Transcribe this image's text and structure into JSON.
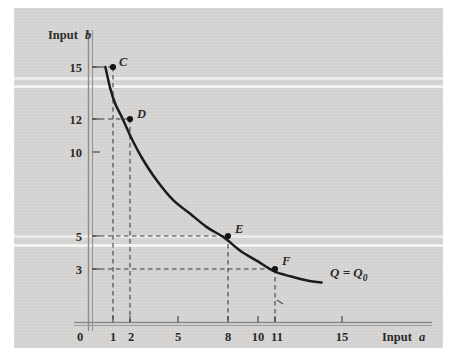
{
  "figure": {
    "background_color": "#d7d6d4",
    "page_color": "#ffffff",
    "ink_color": "#2b2b2b"
  },
  "chart_data": {
    "type": "line",
    "title": "",
    "subtitle": "",
    "xlabel": "Input a",
    "ylabel": "Input b",
    "xlabel_text": "Input",
    "xlabel_var": "a",
    "ylabel_text": "Input",
    "ylabel_var": "b",
    "xlim": [
      0,
      17
    ],
    "ylim": [
      0,
      17
    ],
    "grid": false,
    "legend": "none",
    "xticks": [
      0,
      1,
      2,
      5,
      8,
      10,
      11,
      15
    ],
    "xtick_labels": [
      "0",
      "1",
      "2",
      "5",
      "8",
      "10",
      "11",
      "15"
    ],
    "yticks": [
      3,
      5,
      10,
      12,
      15
    ],
    "ytick_labels": [
      "3",
      "5",
      "10",
      "12",
      "15"
    ],
    "series": [
      {
        "name": "Q = Q0",
        "label": "Q = Q",
        "label_sub": "0",
        "annotation": "isoquant",
        "points": [
          {
            "id": "C",
            "label": "C",
            "x": 1,
            "y": 15
          },
          {
            "id": "D",
            "label": "D",
            "x": 2,
            "y": 12
          },
          {
            "id": "E",
            "label": "E",
            "x": 8,
            "y": 5
          },
          {
            "id": "F",
            "label": "F",
            "x": 11,
            "y": 3
          }
        ],
        "curve": [
          {
            "x": 1.0,
            "y": 15.0
          },
          {
            "x": 1.3,
            "y": 13.7
          },
          {
            "x": 1.6,
            "y": 12.8
          },
          {
            "x": 2.0,
            "y": 12.0
          },
          {
            "x": 2.6,
            "y": 10.7
          },
          {
            "x": 3.2,
            "y": 9.6
          },
          {
            "x": 4.0,
            "y": 8.4
          },
          {
            "x": 5.0,
            "y": 7.2
          },
          {
            "x": 6.0,
            "y": 6.4
          },
          {
            "x": 7.0,
            "y": 5.6
          },
          {
            "x": 8.0,
            "y": 5.0
          },
          {
            "x": 9.0,
            "y": 4.2
          },
          {
            "x": 10.0,
            "y": 3.6
          },
          {
            "x": 11.0,
            "y": 3.0
          },
          {
            "x": 12.0,
            "y": 2.7
          },
          {
            "x": 13.0,
            "y": 2.45
          },
          {
            "x": 13.8,
            "y": 2.35
          }
        ]
      }
    ],
    "guide_lines": "dashed leaders from each axis to points C, D, E, F"
  }
}
